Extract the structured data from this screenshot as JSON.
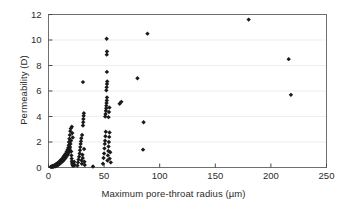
{
  "chart_data": {
    "type": "scatter",
    "title": "",
    "xlabel": "Maximum pore-throat radius (µm)",
    "ylabel": "Permeability (D)",
    "xlim": [
      0,
      250
    ],
    "ylim": [
      0,
      12
    ],
    "xticks": [
      0,
      50,
      100,
      150,
      200,
      250
    ],
    "yticks": [
      0,
      2,
      4,
      6,
      8,
      10,
      12
    ],
    "grid": "horizontal",
    "legend": "none",
    "marker": "diamond",
    "marker_color": "#1a1a1a",
    "points": [
      [
        2.0,
        0.05
      ],
      [
        2.6,
        0.08
      ],
      [
        3.2,
        0.04
      ],
      [
        3.8,
        0.12
      ],
      [
        4.2,
        0.06
      ],
      [
        4.8,
        0.15
      ],
      [
        5.2,
        0.09
      ],
      [
        5.8,
        0.2
      ],
      [
        6.2,
        0.1
      ],
      [
        6.8,
        0.25
      ],
      [
        7.2,
        0.14
      ],
      [
        7.6,
        0.3
      ],
      [
        8.0,
        0.18
      ],
      [
        8.4,
        0.35
      ],
      [
        8.8,
        0.22
      ],
      [
        9.2,
        0.4
      ],
      [
        9.6,
        0.28
      ],
      [
        10.0,
        0.48
      ],
      [
        10.4,
        0.32
      ],
      [
        10.8,
        0.55
      ],
      [
        11.2,
        0.38
      ],
      [
        11.6,
        0.62
      ],
      [
        12.0,
        0.45
      ],
      [
        12.4,
        0.7
      ],
      [
        12.8,
        0.5
      ],
      [
        13.2,
        0.8
      ],
      [
        13.6,
        0.58
      ],
      [
        14.0,
        0.9
      ],
      [
        14.4,
        0.66
      ],
      [
        14.8,
        1.0
      ],
      [
        15.2,
        0.74
      ],
      [
        15.6,
        1.1
      ],
      [
        16.0,
        0.85
      ],
      [
        16.4,
        1.25
      ],
      [
        16.8,
        0.95
      ],
      [
        17.2,
        1.4
      ],
      [
        17.4,
        1.05
      ],
      [
        17.8,
        1.55
      ],
      [
        18.0,
        1.15
      ],
      [
        18.2,
        1.75
      ],
      [
        18.4,
        2.0
      ],
      [
        18.6,
        1.3
      ],
      [
        18.8,
        2.25
      ],
      [
        19.0,
        1.45
      ],
      [
        19.2,
        2.55
      ],
      [
        19.4,
        1.6
      ],
      [
        19.6,
        2.85
      ],
      [
        19.8,
        1.85
      ],
      [
        20.0,
        3.05
      ],
      [
        20.2,
        2.1
      ],
      [
        20.4,
        1.25
      ],
      [
        20.6,
        0.95
      ],
      [
        20.8,
        0.7
      ],
      [
        21.0,
        0.5
      ],
      [
        21.2,
        0.35
      ],
      [
        21.5,
        0.22
      ],
      [
        22.0,
        0.14
      ],
      [
        22.5,
        0.3
      ],
      [
        23.0,
        0.45
      ],
      [
        23.5,
        0.18
      ],
      [
        21.0,
        3.2
      ],
      [
        21.4,
        2.7
      ],
      [
        21.8,
        2.35
      ],
      [
        26.0,
        0.15
      ],
      [
        26.5,
        0.4
      ],
      [
        27.0,
        0.62
      ],
      [
        27.5,
        0.85
      ],
      [
        28.0,
        1.1
      ],
      [
        28.3,
        1.35
      ],
      [
        28.6,
        1.6
      ],
      [
        28.9,
        1.85
      ],
      [
        29.2,
        2.05
      ],
      [
        29.5,
        2.3
      ],
      [
        29.8,
        0.55
      ],
      [
        30.0,
        0.3
      ],
      [
        30.2,
        2.55
      ],
      [
        30.5,
        1.0
      ],
      [
        30.8,
        0.75
      ],
      [
        31.0,
        3.3
      ],
      [
        31.2,
        3.55
      ],
      [
        31.4,
        3.8
      ],
      [
        31.6,
        4.05
      ],
      [
        31.8,
        4.25
      ],
      [
        32.0,
        1.45
      ],
      [
        32.3,
        0.45
      ],
      [
        32.6,
        0.2
      ],
      [
        31.0,
        6.7
      ],
      [
        40.0,
        0.08
      ],
      [
        49.0,
        0.3
      ],
      [
        49.5,
        0.75
      ],
      [
        50.0,
        1.1
      ],
      [
        50.3,
        1.5
      ],
      [
        50.6,
        1.85
      ],
      [
        50.9,
        2.1
      ],
      [
        51.2,
        2.45
      ],
      [
        51.5,
        2.8
      ],
      [
        51.0,
        4.0
      ],
      [
        51.3,
        4.2
      ],
      [
        51.6,
        4.45
      ],
      [
        51.9,
        4.65
      ],
      [
        52.0,
        4.85
      ],
      [
        52.2,
        5.05
      ],
      [
        52.4,
        5.25
      ],
      [
        52.6,
        5.5
      ],
      [
        52.0,
        6.05
      ],
      [
        52.3,
        6.3
      ],
      [
        52.6,
        6.55
      ],
      [
        52.8,
        6.75
      ],
      [
        52.5,
        7.5
      ],
      [
        52.4,
        8.85
      ],
      [
        52.6,
        9.1
      ],
      [
        52.3,
        10.1
      ],
      [
        53.0,
        0.55
      ],
      [
        53.4,
        0.95
      ],
      [
        53.8,
        1.3
      ],
      [
        54.0,
        1.65
      ],
      [
        54.3,
        2.0
      ],
      [
        54.6,
        2.4
      ],
      [
        54.9,
        2.75
      ],
      [
        54.0,
        3.95
      ],
      [
        54.4,
        4.35
      ],
      [
        54.8,
        4.7
      ],
      [
        55.0,
        0.7
      ],
      [
        55.5,
        1.2
      ],
      [
        56.0,
        0.4
      ],
      [
        64.0,
        5.0
      ],
      [
        65.5,
        5.15
      ],
      [
        80.0,
        7.0
      ],
      [
        85.0,
        1.4
      ],
      [
        85.5,
        3.55
      ],
      [
        89.0,
        10.5
      ],
      [
        180.0,
        11.6
      ],
      [
        216.0,
        8.5
      ],
      [
        218.0,
        5.7
      ]
    ]
  }
}
